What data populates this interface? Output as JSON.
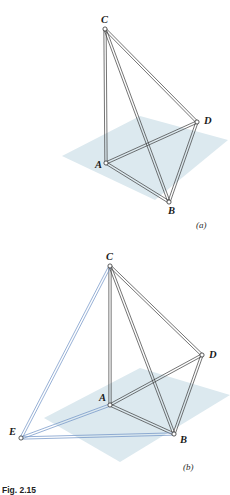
{
  "figure": {
    "caption": "Fig. 2.15",
    "panels": [
      {
        "key": "a",
        "label": "(a)",
        "vertices": [
          {
            "id": "C",
            "label": "C",
            "x": 105,
            "y": 29,
            "label_x": 101,
            "label_y": 23
          },
          {
            "id": "D",
            "label": "D",
            "x": 197,
            "y": 122,
            "label_x": 204,
            "label_y": 124
          },
          {
            "id": "A",
            "label": "A",
            "x": 106,
            "y": 163,
            "label_x": 95,
            "label_y": 168
          },
          {
            "id": "B",
            "label": "B",
            "x": 169,
            "y": 202,
            "label_x": 168,
            "label_y": 214
          }
        ],
        "edges": [
          {
            "from": "C",
            "to": "A",
            "color": "#3a3a3a"
          },
          {
            "from": "C",
            "to": "B",
            "color": "#3a3a3a"
          },
          {
            "from": "C",
            "to": "D",
            "color": "#3a3a3a"
          },
          {
            "from": "A",
            "to": "B",
            "color": "#3a3a3a"
          },
          {
            "from": "A",
            "to": "D",
            "color": "#3a3a3a"
          },
          {
            "from": "B",
            "to": "D",
            "color": "#3a3a3a"
          }
        ],
        "plane": {
          "points": "62,156 140,116 228,140 155,200",
          "fill": "#dce9ef"
        }
      },
      {
        "key": "b",
        "label": "(b)",
        "vertices": [
          {
            "id": "C",
            "label": "C",
            "x": 110,
            "y": 266,
            "label_x": 106,
            "label_y": 260
          },
          {
            "id": "D",
            "label": "D",
            "x": 202,
            "y": 355,
            "label_x": 209,
            "label_y": 358
          },
          {
            "id": "A",
            "label": "A",
            "x": 110,
            "y": 405,
            "label_x": 99,
            "label_y": 401
          },
          {
            "id": "B",
            "label": "B",
            "x": 174,
            "y": 434,
            "label_x": 180,
            "label_y": 443
          },
          {
            "id": "E",
            "label": "E",
            "x": 21,
            "y": 438,
            "label_x": 9,
            "label_y": 435
          }
        ],
        "edges": [
          {
            "from": "C",
            "to": "A",
            "color": "#3a3a3a"
          },
          {
            "from": "C",
            "to": "B",
            "color": "#3a3a3a"
          },
          {
            "from": "C",
            "to": "D",
            "color": "#3a3a3a"
          },
          {
            "from": "A",
            "to": "B",
            "color": "#3a3a3a"
          },
          {
            "from": "A",
            "to": "D",
            "color": "#3a3a3a"
          },
          {
            "from": "B",
            "to": "D",
            "color": "#3a3a3a"
          },
          {
            "from": "C",
            "to": "E",
            "color": "#6b8fc4"
          },
          {
            "from": "A",
            "to": "E",
            "color": "#6b8fc4"
          },
          {
            "from": "B",
            "to": "E",
            "color": "#6b8fc4"
          }
        ],
        "plane": {
          "points": "44,418 140,368 230,395 120,462",
          "fill": "#dce9ef"
        }
      }
    ],
    "style": {
      "edge_color_black": "#3a3a3a",
      "edge_color_blue": "#6b8fc4",
      "plane_fill": "#dce9ef",
      "node_fill": "#ffffff",
      "background": "#ffffff"
    }
  }
}
